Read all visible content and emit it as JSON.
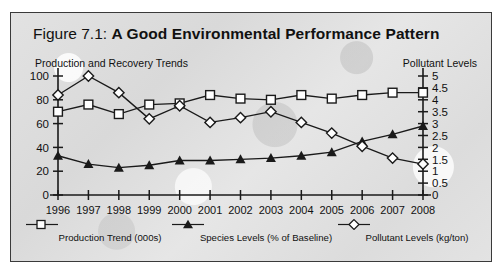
{
  "figure": {
    "number_label": "Figure 7.1:",
    "title": "A Good Environmental Performance Pattern",
    "left_axis_caption": "Production and Recovery Trends",
    "right_axis_caption": "Pollutant Levels"
  },
  "legend": [
    {
      "marker": "open-square-marker",
      "label": "Production Trend (000s)"
    },
    {
      "marker": "filled-triangle-marker",
      "label": "Species Levels (% of Baseline)"
    },
    {
      "marker": "open-diamond-marker",
      "label": "Pollutant Levels (kg/ton)"
    }
  ],
  "colors": {
    "line": "#1a1a1a",
    "marker_fill": "#ffffff",
    "marker_fill_solid": "#1a1a1a",
    "frame": "#3a3a3a",
    "background": "#dededd"
  },
  "chart_data": {
    "type": "line",
    "title": "Figure 7.1: A Good Environmental Performance Pattern",
    "xlabel": "",
    "ylabel": "Production and Recovery Trends",
    "y2label": "Pollutant Levels",
    "categories": [
      "1996",
      "1997",
      "1998",
      "1999",
      "2000",
      "2001",
      "2002",
      "2003",
      "2004",
      "2005",
      "2006",
      "2007",
      "2008"
    ],
    "ylim": [
      0,
      100
    ],
    "yticks": [
      0,
      20,
      40,
      60,
      80,
      100
    ],
    "y2lim": [
      0,
      5
    ],
    "y2ticks": [
      0,
      0.5,
      1,
      1.5,
      2,
      2.5,
      3,
      3.5,
      4,
      4.5,
      5
    ],
    "grid": false,
    "legend_position": "bottom",
    "series": [
      {
        "name": "Production Trend (000s)",
        "axis": "left",
        "marker": "open-square",
        "values": [
          70,
          76,
          68,
          76,
          77,
          84,
          81,
          80,
          84,
          81,
          84,
          86,
          86
        ]
      },
      {
        "name": "Species Levels (% of Baseline)",
        "axis": "left",
        "marker": "filled-triangle",
        "values": [
          33,
          26,
          23,
          25,
          29,
          29,
          30,
          31,
          33,
          36,
          45,
          51,
          58
        ]
      },
      {
        "name": "Pollutant Levels (kg/ton)",
        "axis": "right",
        "marker": "open-diamond",
        "values": [
          4.2,
          5.0,
          4.3,
          3.2,
          3.75,
          3.05,
          3.25,
          3.5,
          3.05,
          2.6,
          2.05,
          1.55,
          1.3
        ],
        "values_left_scale": [
          84,
          100,
          86,
          64,
          75,
          61,
          65,
          70,
          61,
          52,
          41,
          31,
          26
        ]
      }
    ]
  }
}
